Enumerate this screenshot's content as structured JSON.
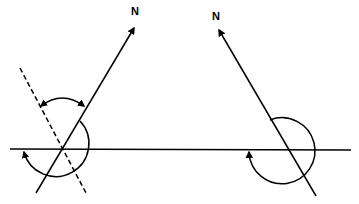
{
  "diagram": {
    "type": "bearing-diagrams",
    "stroke_color": "#000000",
    "background": "#ffffff",
    "left": {
      "north_label": "N",
      "north_arrow": {
        "x1": 36,
        "y1": 193,
        "x2": 134,
        "y2": 27
      },
      "horizontal_line": {
        "x1": 10,
        "y1": 149,
        "x2": 359,
        "y2": 149
      },
      "dashed_line": {
        "x1": 20,
        "y1": 68,
        "x2": 86,
        "y2": 193
      },
      "circle_arc": {
        "cx": 62,
        "cy": 149,
        "r": 33
      },
      "double_arrow_arc": {
        "from": [
          40,
          107
        ],
        "to": [
          84,
          107
        ]
      },
      "arc_arrow_at": [
        24,
        153
      ]
    },
    "right": {
      "north_label": "N",
      "north_arrow": {
        "x1": 316,
        "y1": 196,
        "x2": 218,
        "y2": 28
      },
      "horizontal_line": {
        "x1": 180,
        "y1": 150,
        "x2": 351,
        "y2": 150
      },
      "circle_arc": {
        "cx": 290,
        "cy": 150,
        "r": 33
      },
      "arc_arrow_at": [
        249,
        153
      ]
    }
  }
}
